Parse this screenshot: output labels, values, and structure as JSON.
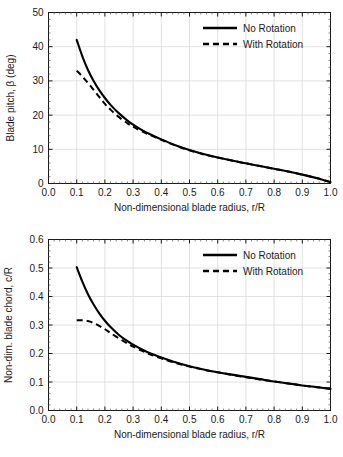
{
  "figure": {
    "background_color": "#ffffff",
    "line_color": "#000000",
    "grid_color": "#d9d9d9",
    "axis_color": "#1a1a1a"
  },
  "chart_data": [
    {
      "id": "blade-pitch",
      "type": "line",
      "title": "",
      "xlabel": "Non-dimensional blade radius, r/R",
      "ylabel": "Blade pitch, β (deg)",
      "xlim": [
        0.0,
        1.0
      ],
      "ylim": [
        0,
        50
      ],
      "xticks": [
        "0.0",
        "0.1",
        "0.2",
        "0.3",
        "0.4",
        "0.5",
        "0.6",
        "0.7",
        "0.8",
        "0.9",
        "1.0"
      ],
      "xtick_values": [
        0.0,
        0.1,
        0.2,
        0.3,
        0.4,
        0.5,
        0.6,
        0.7,
        0.8,
        0.9,
        1.0
      ],
      "yticks": [
        "0",
        "10",
        "20",
        "30",
        "40",
        "50"
      ],
      "ytick_values": [
        0,
        10,
        20,
        30,
        40,
        50
      ],
      "minor_ticks": true,
      "grid": true,
      "legend_position": "top-right",
      "x": [
        0.1,
        0.12,
        0.14,
        0.16,
        0.18,
        0.2,
        0.22,
        0.25,
        0.28,
        0.3,
        0.33,
        0.36,
        0.4,
        0.45,
        0.5,
        0.55,
        0.6,
        0.65,
        0.7,
        0.75,
        0.8,
        0.85,
        0.9,
        0.95,
        1.0
      ],
      "series": [
        {
          "name": "No Rotation",
          "style": "solid",
          "values": [
            42.0,
            37.2,
            33.2,
            30.0,
            27.3,
            25.0,
            23.0,
            20.5,
            18.4,
            17.2,
            15.7,
            14.4,
            12.9,
            11.2,
            9.8,
            8.6,
            7.6,
            6.7,
            5.9,
            5.1,
            4.3,
            3.5,
            2.6,
            1.6,
            0.4
          ]
        },
        {
          "name": "With Rotation",
          "style": "dashed",
          "values": [
            33.0,
            31.3,
            29.4,
            27.4,
            25.3,
            23.3,
            21.6,
            19.4,
            17.6,
            16.6,
            15.3,
            14.2,
            12.8,
            11.1,
            9.7,
            8.5,
            7.6,
            6.7,
            5.9,
            5.1,
            4.3,
            3.5,
            2.6,
            1.6,
            0.4
          ]
        }
      ]
    },
    {
      "id": "blade-chord",
      "type": "line",
      "title": "",
      "xlabel": "Non-dimensional blade radius, r/R",
      "ylabel": "Non-dim. blade chord, c/R",
      "xlim": [
        0.0,
        1.0
      ],
      "ylim": [
        0.0,
        0.6
      ],
      "xticks": [
        "0.0",
        "0.1",
        "0.2",
        "0.3",
        "0.4",
        "0.5",
        "0.6",
        "0.7",
        "0.8",
        "0.9",
        "1.0"
      ],
      "xtick_values": [
        0.0,
        0.1,
        0.2,
        0.3,
        0.4,
        0.5,
        0.6,
        0.7,
        0.8,
        0.9,
        1.0
      ],
      "yticks": [
        "0.0",
        "0.1",
        "0.2",
        "0.3",
        "0.4",
        "0.5",
        "0.6"
      ],
      "ytick_values": [
        0.0,
        0.1,
        0.2,
        0.3,
        0.4,
        0.5,
        0.6
      ],
      "minor_ticks": true,
      "grid": true,
      "legend_position": "top-right",
      "x": [
        0.1,
        0.12,
        0.14,
        0.16,
        0.18,
        0.2,
        0.22,
        0.25,
        0.28,
        0.3,
        0.33,
        0.36,
        0.4,
        0.45,
        0.5,
        0.55,
        0.6,
        0.65,
        0.7,
        0.75,
        0.8,
        0.85,
        0.9,
        0.95,
        1.0
      ],
      "series": [
        {
          "name": "No Rotation",
          "style": "solid",
          "values": [
            0.503,
            0.452,
            0.408,
            0.372,
            0.341,
            0.315,
            0.293,
            0.265,
            0.243,
            0.231,
            0.215,
            0.201,
            0.186,
            0.169,
            0.155,
            0.144,
            0.134,
            0.126,
            0.118,
            0.11,
            0.102,
            0.095,
            0.088,
            0.082,
            0.076
          ]
        },
        {
          "name": "With Rotation",
          "style": "dashed",
          "values": [
            0.316,
            0.317,
            0.314,
            0.307,
            0.297,
            0.285,
            0.272,
            0.253,
            0.235,
            0.224,
            0.21,
            0.197,
            0.183,
            0.167,
            0.154,
            0.143,
            0.134,
            0.125,
            0.117,
            0.109,
            0.102,
            0.095,
            0.088,
            0.082,
            0.076
          ]
        }
      ]
    }
  ]
}
